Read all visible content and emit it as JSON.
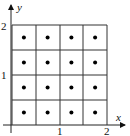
{
  "diagram": {
    "type": "grid-with-midpoints",
    "axes": {
      "x": {
        "label": "x",
        "ticks": [
          {
            "value": 1,
            "label": "1"
          },
          {
            "value": 2,
            "label": "2"
          }
        ]
      },
      "y": {
        "label": "y",
        "ticks": [
          {
            "value": 1,
            "label": "1"
          },
          {
            "value": 2,
            "label": "2"
          }
        ]
      }
    },
    "grid": {
      "x_range": [
        0,
        2
      ],
      "y_range": [
        0,
        2
      ],
      "divisions_x": 4,
      "divisions_y": 4
    },
    "points": [
      [
        0.25,
        0.25
      ],
      [
        0.75,
        0.25
      ],
      [
        1.25,
        0.25
      ],
      [
        1.75,
        0.25
      ],
      [
        0.25,
        0.75
      ],
      [
        0.75,
        0.75
      ],
      [
        1.25,
        0.75
      ],
      [
        1.75,
        0.75
      ],
      [
        0.25,
        1.25
      ],
      [
        0.75,
        1.25
      ],
      [
        1.25,
        1.25
      ],
      [
        1.75,
        1.25
      ],
      [
        0.25,
        1.75
      ],
      [
        0.75,
        1.75
      ],
      [
        1.25,
        1.75
      ],
      [
        1.75,
        1.75
      ]
    ],
    "colors": {
      "line": "#222222",
      "point": "#000000"
    }
  }
}
